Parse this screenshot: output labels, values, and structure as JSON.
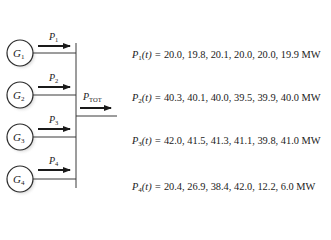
{
  "diagram": {
    "type": "power-system-generators-to-bus",
    "generators": [
      {
        "label": "G",
        "sub": "1",
        "power_label": "P",
        "power_sub": "1"
      },
      {
        "label": "G",
        "sub": "2",
        "power_label": "P",
        "power_sub": "2"
      },
      {
        "label": "G",
        "sub": "3",
        "power_label": "P",
        "power_sub": "3"
      },
      {
        "label": "G",
        "sub": "4",
        "power_label": "P",
        "power_sub": "4"
      }
    ],
    "output": {
      "label": "P",
      "sub": "TOT"
    }
  },
  "equations": [
    {
      "sym": "P",
      "sub": "1",
      "arg": "(t) = ",
      "values": "20.0, 19.8, 20.1, 20.0, 20.0, 19.9 MW"
    },
    {
      "sym": "P",
      "sub": "2",
      "arg": "(t) = ",
      "values": "40.3, 40.1, 40.0, 39.5, 39.9, 40.0 MW"
    },
    {
      "sym": "P",
      "sub": "3",
      "arg": "(t) = ",
      "values": "42.0, 41.5, 41.3, 41.1, 39.8, 41.0 MW"
    },
    {
      "sym": "P",
      "sub": "4",
      "arg": "(t) = ",
      "values": "20.4, 26.9, 38.4, 42.0, 12.2, 6.0 MW"
    }
  ],
  "colors": {
    "line": "#3a3a3a",
    "arrow": "#1a1a1a",
    "circle_stroke": "#2a2a2a",
    "shadow": "#c8c8c8"
  }
}
